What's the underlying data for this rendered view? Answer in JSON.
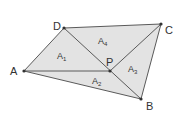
{
  "diagram": {
    "title": "",
    "colors": {
      "fill": "#e3e3e3",
      "stroke": "#5a5a5a",
      "point": "#333333",
      "text": "#333333"
    },
    "vertices": {
      "A": {
        "x": 24,
        "y": 71,
        "label": "A"
      },
      "B": {
        "x": 141,
        "y": 99,
        "label": "B"
      },
      "C": {
        "x": 161,
        "y": 24,
        "label": "C"
      },
      "D": {
        "x": 64,
        "y": 28,
        "label": "D"
      },
      "P": {
        "x": 110,
        "y": 71,
        "label": "P"
      }
    },
    "edges": [
      [
        "A",
        "B"
      ],
      [
        "B",
        "C"
      ],
      [
        "C",
        "D"
      ],
      [
        "D",
        "A"
      ],
      [
        "A",
        "P"
      ],
      [
        "D",
        "B"
      ],
      [
        "P",
        "C"
      ]
    ],
    "regions": [
      {
        "name": "A1",
        "base": "A",
        "sub": "1",
        "triangle": [
          "A",
          "D",
          "P"
        ]
      },
      {
        "name": "A2",
        "base": "A",
        "sub": "2",
        "triangle": [
          "A",
          "P",
          "B"
        ]
      },
      {
        "name": "A3",
        "base": "A",
        "sub": "3",
        "triangle": [
          "P",
          "B",
          "C"
        ]
      },
      {
        "name": "A4",
        "base": "A",
        "sub": "4",
        "triangle": [
          "D",
          "P",
          "C"
        ]
      }
    ]
  }
}
